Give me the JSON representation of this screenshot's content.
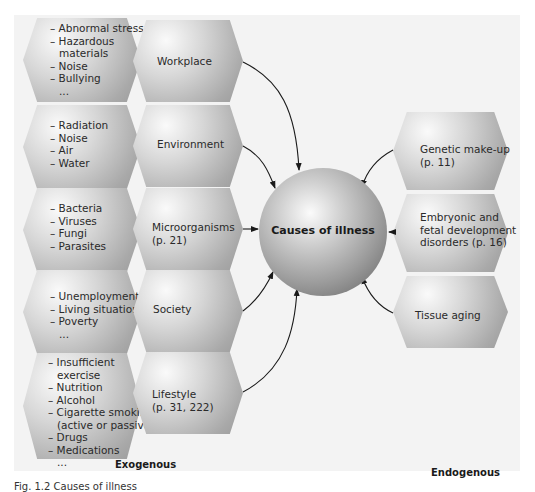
{
  "center": {
    "label": "Causes of illness"
  },
  "exogenous": {
    "label": "Exogenous",
    "factors": [
      {
        "name": "Workplace",
        "examples": [
          "Abnormal stress",
          "Hazardous materials",
          "Noise",
          "Bullying",
          "..."
        ]
      },
      {
        "name": "Environment",
        "examples": [
          "Radiation",
          "Noise",
          "Air",
          "Water"
        ]
      },
      {
        "name": "Microorganisms",
        "page": "(p. 21)",
        "examples": [
          "Bacteria",
          "Viruses",
          "Fungi",
          "Parasites"
        ]
      },
      {
        "name": "Society",
        "examples": [
          "Unemployment",
          "Living situation",
          "Poverty",
          "..."
        ]
      },
      {
        "name": "Lifestyle",
        "page": "(p. 31, 222)",
        "examples": [
          "Insufficient exercise",
          "Nutrition",
          "Alcohol",
          "Cigarette smoking (active or passive)",
          "Drugs",
          "Medications",
          "..."
        ]
      }
    ]
  },
  "endogenous": {
    "label": "Endogenous",
    "factors": [
      {
        "line1": "Genetic make-up",
        "line2": "(p. 11)"
      },
      {
        "line1": "Embryonic and",
        "line2": "fetal development",
        "line3": "disorders (p. 16)"
      },
      {
        "line1": "Tissue aging"
      }
    ]
  },
  "caption": "Fig. 1.2 Causes of illness"
}
